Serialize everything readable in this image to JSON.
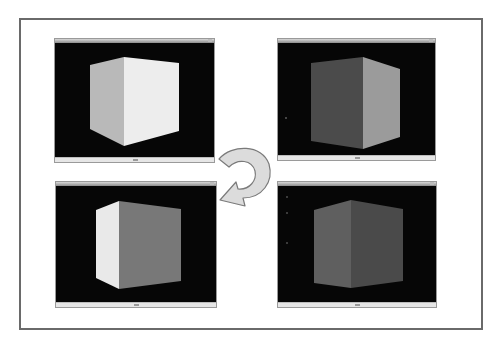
{
  "diagram": {
    "arrow": {
      "icon": "rotate-arrow-icon",
      "fill": "#dcdcdc",
      "stroke": "#7a7a7a"
    },
    "windows": [
      {
        "id": "top-left",
        "title": "",
        "status": "",
        "cube": {
          "left_face": "#b9b9b9",
          "right_face": "#ededed"
        }
      },
      {
        "id": "top-right",
        "title": "",
        "status": "",
        "cube": {
          "left_face": "#4b4b4b",
          "right_face": "#9b9b9b"
        }
      },
      {
        "id": "bottom-left",
        "title": "",
        "status": "",
        "cube": {
          "left_face": "#e9e9e9",
          "right_face": "#787878"
        }
      },
      {
        "id": "bottom-right",
        "title": "",
        "status": "",
        "cube": {
          "left_face": "#5f5f5f",
          "right_face": "#4a4a4a"
        }
      }
    ],
    "colors": {
      "frame_border": "#6a6a6a",
      "viewport_background": "#060606",
      "page_background": "#ffffff"
    }
  }
}
